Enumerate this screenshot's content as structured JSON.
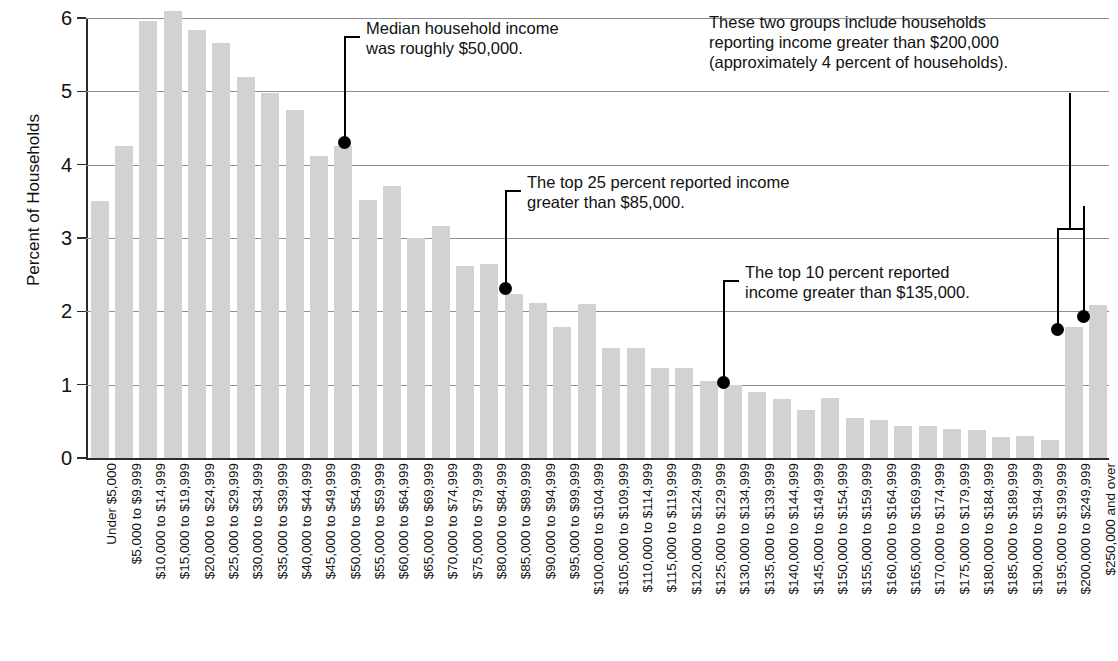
{
  "chart_data": {
    "type": "bar",
    "title": "",
    "xlabel": "",
    "ylabel": "Percent of Households",
    "ylim": [
      0,
      6
    ],
    "yticks": [
      0,
      1,
      2,
      3,
      4,
      5,
      6
    ],
    "ytick_labels": [
      "0",
      "1",
      "2",
      "3",
      "4",
      "5",
      "6"
    ],
    "grid": true,
    "legend": "none",
    "bar_color": "#d2d2d2",
    "categories": [
      "Under $5,000",
      "$5,000 to $9,999",
      "$10,000 to $14,999",
      "$15,000 to $19,999",
      "$20,000 to $24,999",
      "$25,000 to $29,999",
      "$30,000 to $34,999",
      "$35,000 to $39,999",
      "$40,000 to $44,999",
      "$45,000 to $49,999",
      "$50,000 to $54,999",
      "$55,000 to $59,999",
      "$60,000 to $64,999",
      "$65,000 to $69,999",
      "$70,000 to $74,999",
      "$75,000 to $79,999",
      "$80,000 to $84,999",
      "$85,000 to $89,999",
      "$90,000 to $94,999",
      "$95,000 to $99,999",
      "$100,000 to $104,999",
      "$105,000 to $109,999",
      "$110,000 to $114,999",
      "$115,000 to $119,999",
      "$120,000 to $124,999",
      "$125,000 to $129,999",
      "$130,000 to $134,999",
      "$135,000 to $139,999",
      "$140,000 to $144,999",
      "$145,000 to $149,999",
      "$150,000 to $154,999",
      "$155,000 to $159,999",
      "$160,000 to $164,999",
      "$165,000 to $169,999",
      "$170,000 to $174,999",
      "$175,000 to $179,999",
      "$180,000 to $184,999",
      "$185,000 to $189,999",
      "$190,000 to $194,999",
      "$195,000 to $199,999",
      "$200,000 to $249,999",
      "$250,000 and over"
    ],
    "values": [
      3.5,
      4.26,
      5.96,
      6.1,
      5.84,
      5.66,
      5.2,
      4.98,
      4.74,
      4.12,
      4.25,
      3.52,
      3.71,
      3.0,
      3.17,
      2.62,
      2.65,
      2.23,
      2.12,
      1.78,
      2.1,
      1.5,
      1.5,
      1.23,
      1.23,
      1.05,
      1.0,
      0.9,
      0.81,
      0.66,
      0.82,
      0.55,
      0.52,
      0.44,
      0.44,
      0.39,
      0.38,
      0.28,
      0.3,
      0.24,
      1.78,
      2.08
    ]
  },
  "annotations": [
    {
      "id": "median-income",
      "text": "Median household income\nwas roughly $50,000.",
      "target_category": "$50,000 to $54,999",
      "target_value": 4.25
    },
    {
      "id": "top-25-percent",
      "text": "The top 25 percent reported income\ngreater than $85,000.",
      "target_category": "$85,000 to $89,999",
      "target_value": 2.23
    },
    {
      "id": "top-10-percent",
      "text": "The top 10 percent reported\nincome greater than $135,000.",
      "target_category": "$130,000 to $134,999",
      "target_value": 1.0
    },
    {
      "id": "two-groups-over-200k",
      "text": "These two groups include households\nreporting income greater than $200,000\n(approximately 4 percent of households).",
      "target_categories": [
        "$200,000 to $249,999",
        "$250,000 and over"
      ],
      "target_values": [
        1.78,
        2.08
      ]
    }
  ]
}
